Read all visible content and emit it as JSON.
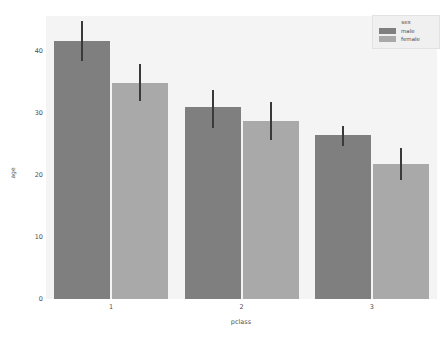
{
  "chart_data": {
    "type": "bar",
    "title": "",
    "xlabel": "pclass",
    "ylabel": "age",
    "categories": [
      "1",
      "2",
      "3"
    ],
    "series": [
      {
        "name": "male",
        "color": "#7f7f7f",
        "values": [
          41.5,
          31.0,
          26.5
        ],
        "errors_low": [
          38.3,
          27.5,
          24.6
        ],
        "errors_high": [
          44.8,
          33.7,
          27.9
        ]
      },
      {
        "name": "female",
        "color": "#a9a9a9",
        "values": [
          34.8,
          28.7,
          21.8
        ],
        "errors_low": [
          31.9,
          25.6,
          19.1
        ],
        "errors_high": [
          37.8,
          31.7,
          24.3
        ]
      }
    ],
    "yticks": [
      0,
      10,
      20,
      30,
      40
    ],
    "ylim": [
      0,
      45.6
    ],
    "xticklabels": [
      "1",
      "2",
      "3"
    ],
    "grid": false,
    "legend": {
      "title": "sex",
      "position": "upper right",
      "entries": [
        "male",
        "female"
      ]
    }
  },
  "axes": {
    "y_label": "age",
    "x_label": "pclass",
    "y_tick_labels": [
      "0",
      "10",
      "20",
      "30",
      "40"
    ],
    "x_tick_labels": [
      "1",
      "2",
      "3"
    ]
  },
  "legend": {
    "title": "sex",
    "items": [
      {
        "label": "male",
        "color": "#7f7f7f"
      },
      {
        "label": "female",
        "color": "#a9a9a9"
      }
    ]
  },
  "style": {
    "figure_background": "#ffffff",
    "axes_background": "#f4f4f4",
    "error_bar_color": "#3a3a3a",
    "tick_color": "#4d4d4d"
  }
}
